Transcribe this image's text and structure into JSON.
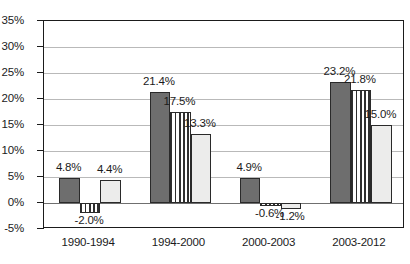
{
  "chart_data": {
    "type": "bar",
    "title": "",
    "subtitle": "",
    "xlabel": "",
    "ylabel": "",
    "categories": [
      "1990-1994",
      "1994-2000",
      "2000-2003",
      "2003-2012"
    ],
    "series": [
      {
        "name": "series-1",
        "pattern": "solid-dark-gray",
        "color": "#6e6e6e",
        "values": [
          4.8,
          21.4,
          4.9,
          23.2
        ],
        "labels": [
          "4.8%",
          "21.4%",
          "4.9%",
          "23.2%"
        ]
      },
      {
        "name": "series-2",
        "pattern": "vertical-stripes",
        "color": "#2f2f2f",
        "values": [
          -2.0,
          17.5,
          -0.6,
          21.8
        ],
        "labels": [
          "-2.0%",
          "17.5%",
          "-0.6%",
          "21.8%"
        ]
      },
      {
        "name": "series-3",
        "pattern": "solid-light-gray",
        "color": "#ececeb",
        "values": [
          4.4,
          13.3,
          -1.2,
          15.0
        ],
        "labels": [
          "4.4%",
          "13.3%",
          "-1.2%",
          "15.0%"
        ]
      }
    ],
    "ylim": [
      -5,
      35
    ],
    "ytick_step": 5,
    "ytick_labels": [
      "35%",
      "30%",
      "25%",
      "20%",
      "15%",
      "10%",
      "5%",
      "0%",
      "-5%"
    ],
    "ytick_values": [
      35,
      30,
      25,
      20,
      15,
      10,
      5,
      0,
      -5
    ],
    "grid": true,
    "legend": "none",
    "value_suffix": "%"
  }
}
